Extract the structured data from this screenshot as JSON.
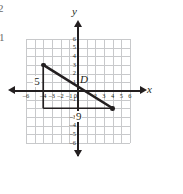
{
  "figure": {
    "kind": "coordinate-plane-graph",
    "axis_labels": {
      "x": "x",
      "y": "y"
    },
    "margin_text": [
      "2",
      "1"
    ],
    "grid": {
      "x_min": -6,
      "x_max": 6,
      "y_min": -6,
      "y_max": 6,
      "step": 1,
      "grid_visible": true,
      "grid_color": "#c8c9cb",
      "axis_color": "#231f20"
    },
    "x_tick_labels": [
      {
        "value": -6,
        "text": "–6"
      },
      {
        "value": -4,
        "text": "–4"
      },
      {
        "value": -3,
        "text": "–3"
      },
      {
        "value": -2,
        "text": "–2"
      },
      {
        "value": -1,
        "text": "–1"
      },
      {
        "value": 0,
        "text": "0"
      },
      {
        "value": 2,
        "text": "2"
      },
      {
        "value": 3,
        "text": "3"
      },
      {
        "value": 4,
        "text": "4"
      },
      {
        "value": 5,
        "text": "5"
      },
      {
        "value": 6,
        "text": "6"
      }
    ],
    "y_tick_labels": [
      {
        "value": 6,
        "text": "6"
      },
      {
        "value": 5,
        "text": "5"
      },
      {
        "value": 4,
        "text": "4"
      },
      {
        "value": 3,
        "text": "3"
      },
      {
        "value": 2,
        "text": "2"
      },
      {
        "value": 1,
        "text": "1"
      },
      {
        "value": -1,
        "text": "–1"
      },
      {
        "value": -3,
        "text": "–3"
      },
      {
        "value": -4,
        "text": "–4"
      },
      {
        "value": -5,
        "text": "–5"
      },
      {
        "value": -6,
        "text": "–6"
      }
    ],
    "segment": {
      "label": "D",
      "endpoints": [
        {
          "x": -4,
          "y": 3
        },
        {
          "x": 4,
          "y": -2
        }
      ],
      "color": "#231f20"
    },
    "right_triangle": {
      "vertical_leg": {
        "label": "5",
        "from": {
          "x": -4,
          "y": 3
        },
        "to": {
          "x": -4,
          "y": -2
        }
      },
      "horizontal_leg": {
        "label": "9",
        "from": {
          "x": -4,
          "y": -2
        },
        "to": {
          "x": 4,
          "y": -2
        }
      }
    }
  }
}
